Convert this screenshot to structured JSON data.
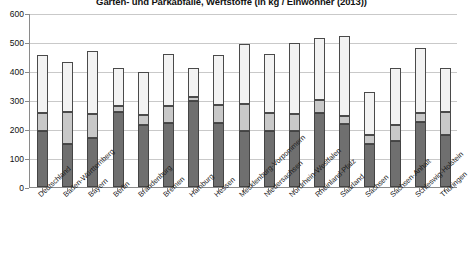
{
  "chart_data": {
    "type": "bar",
    "subtype": "stacked-bar",
    "title": "Garten- und Parkabfälle, Wertstoffe (in kg / Einwohner (2013))",
    "xlabel": "",
    "ylabel": "",
    "ylim": [
      0,
      600
    ],
    "ytick_step": 100,
    "yticks": [
      "0",
      "100",
      "200",
      "300",
      "400",
      "500",
      "600"
    ],
    "grid": true,
    "grid_axis": "y",
    "legend": "none",
    "categories": [
      "Deutschland",
      "Baden-Württemberg",
      "Bayern",
      "Berlin",
      "Brandenburg",
      "Bremen",
      "Hamburg",
      "Hessen",
      "Mecklenburg-Vorpommern",
      "Niedersachsen",
      "Nordrhein-Westfalen",
      "Rheinland-Pfalz",
      "Saarland",
      "Sachsen",
      "Sachsen-Anhalt",
      "Schleswig-Holstein",
      "Thüringen"
    ],
    "series": [
      {
        "name": "Garten- und Parkabfälle",
        "color": "#6f6f6f",
        "values": [
          193,
          148,
          168,
          258,
          215,
          222,
          296,
          222,
          192,
          193,
          193,
          255,
          218,
          148,
          158,
          223,
          178
        ]
      },
      {
        "name": "Wertstoffe",
        "color": "#c8c8c8",
        "values": [
          62,
          110,
          83,
          22,
          35,
          57,
          13,
          62,
          95,
          62,
          58,
          45,
          28,
          33,
          55,
          33,
          80
        ]
      },
      {
        "name": "Sonstige",
        "color": "#f3f3f3",
        "values": [
          200,
          172,
          218,
          130,
          148,
          178,
          100,
          171,
          205,
          205,
          245,
          215,
          275,
          148,
          197,
          222,
          152
        ]
      }
    ],
    "totals": [
      455,
      430,
      469,
      410,
      398,
      457,
      409,
      455,
      492,
      460,
      496,
      515,
      521,
      329,
      410,
      478,
      410
    ]
  }
}
